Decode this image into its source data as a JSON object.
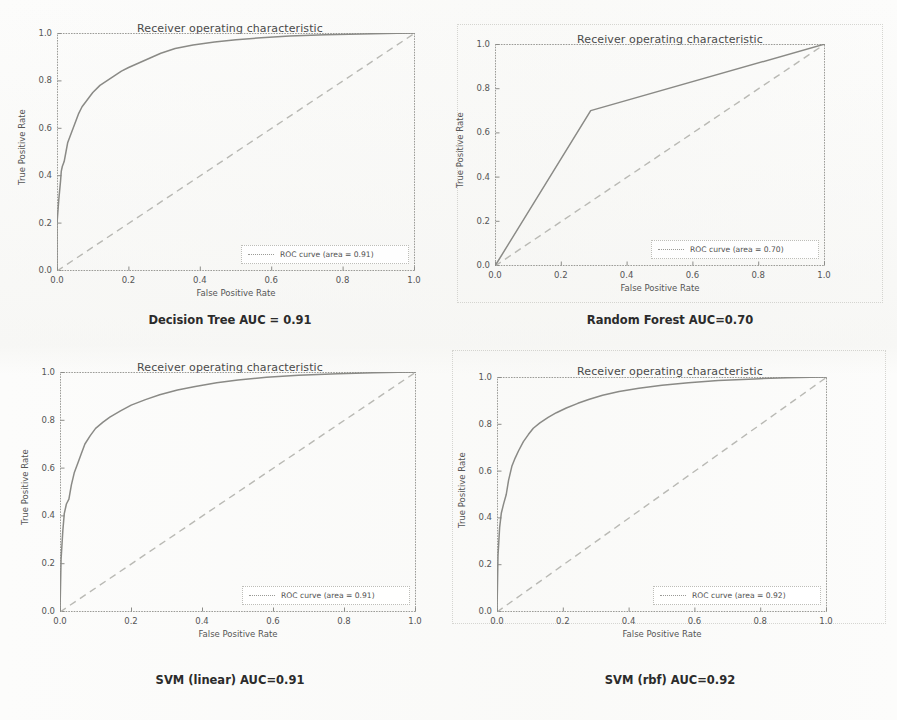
{
  "figure": {
    "background_color": "#fcfcfb",
    "panel_count": 4,
    "layout": "2x2 grid of ROC curve subplots"
  },
  "common": {
    "chart_title": "Receiver operating characteristic",
    "xlabel": "False Positive Rate",
    "ylabel": "True Positive Rate",
    "xticks": [
      "0.0",
      "0.2",
      "0.4",
      "0.6",
      "0.8",
      "1.0"
    ],
    "yticks": [
      "0.0",
      "0.2",
      "0.4",
      "0.6",
      "0.8",
      "1.0"
    ],
    "curve_color": "#8a8a86",
    "chance_color": "#b9b9b4"
  },
  "panels": [
    {
      "id": "decision-tree",
      "title": "Receiver operating characteristic",
      "legend_label": "ROC curve (area = 0.91)",
      "caption": "Decision Tree AUC = 0.91",
      "auc": 0.91
    },
    {
      "id": "random-forest",
      "title": "Receiver operating characteristic",
      "legend_label": "ROC curve (area = 0.70)",
      "caption": "Random Forest AUC=0.70",
      "auc": 0.7
    },
    {
      "id": "svm-linear",
      "title": "Receiver operating characteristic",
      "legend_label": "ROC curve (area = 0.91)",
      "caption": "SVM (linear) AUC=0.91",
      "auc": 0.91
    },
    {
      "id": "svm-rbf",
      "title": "Receiver operating characteristic",
      "legend_label": "ROC curve (area = 0.92)",
      "caption": "SVM (rbf) AUC=0.92",
      "auc": 0.92
    }
  ],
  "chart_data": [
    {
      "type": "line",
      "id": "decision-tree",
      "title": "Receiver operating characteristic",
      "xlabel": "False Positive Rate",
      "ylabel": "True Positive Rate",
      "xlim": [
        0.0,
        1.0
      ],
      "ylim": [
        0.0,
        1.0
      ],
      "grid": false,
      "legend_position": "lower right",
      "series": [
        {
          "name": "ROC curve (area = 0.91)",
          "style": "solid",
          "auc": 0.91,
          "x": [
            0.0,
            0.0,
            0.005,
            0.01,
            0.012,
            0.015,
            0.02,
            0.025,
            0.03,
            0.04,
            0.05,
            0.06,
            0.07,
            0.08,
            0.09,
            0.1,
            0.12,
            0.14,
            0.16,
            0.18,
            0.2,
            0.23,
            0.26,
            0.29,
            0.33,
            0.38,
            0.44,
            0.5,
            0.57,
            0.65,
            0.75,
            0.85,
            0.95,
            1.0
          ],
          "y": [
            0.0,
            0.2,
            0.3,
            0.38,
            0.42,
            0.44,
            0.46,
            0.5,
            0.54,
            0.58,
            0.62,
            0.66,
            0.69,
            0.71,
            0.73,
            0.75,
            0.78,
            0.8,
            0.82,
            0.84,
            0.855,
            0.875,
            0.895,
            0.915,
            0.935,
            0.95,
            0.962,
            0.972,
            0.98,
            0.987,
            0.993,
            0.996,
            0.999,
            1.0
          ]
        },
        {
          "name": "chance",
          "style": "dashed",
          "x": [
            0.0,
            1.0
          ],
          "y": [
            0.0,
            1.0
          ]
        }
      ]
    },
    {
      "type": "line",
      "id": "random-forest",
      "title": "Receiver operating characteristic",
      "xlabel": "False Positive Rate",
      "ylabel": "True Positive Rate",
      "xlim": [
        0.0,
        1.0
      ],
      "ylim": [
        0.0,
        1.0
      ],
      "grid": false,
      "legend_position": "lower right",
      "series": [
        {
          "name": "ROC curve (area = 0.70)",
          "style": "solid",
          "auc": 0.7,
          "x": [
            0.0,
            0.29,
            1.0
          ],
          "y": [
            0.0,
            0.7,
            1.0
          ]
        },
        {
          "name": "chance",
          "style": "dashed",
          "x": [
            0.0,
            1.0
          ],
          "y": [
            0.0,
            1.0
          ]
        }
      ]
    },
    {
      "type": "line",
      "id": "svm-linear",
      "title": "Receiver operating characteristic",
      "xlabel": "False Positive Rate",
      "ylabel": "True Positive Rate",
      "xlim": [
        0.0,
        1.0
      ],
      "ylim": [
        0.0,
        1.0
      ],
      "grid": false,
      "legend_position": "lower right",
      "series": [
        {
          "name": "ROC curve (area = 0.91)",
          "style": "solid",
          "auc": 0.91,
          "x": [
            0.0,
            0.003,
            0.008,
            0.012,
            0.018,
            0.025,
            0.032,
            0.04,
            0.05,
            0.06,
            0.07,
            0.085,
            0.1,
            0.12,
            0.14,
            0.17,
            0.2,
            0.24,
            0.28,
            0.33,
            0.38,
            0.44,
            0.5,
            0.58,
            0.67,
            0.78,
            0.88,
            0.95,
            1.0
          ],
          "y": [
            0.0,
            0.22,
            0.34,
            0.41,
            0.45,
            0.47,
            0.53,
            0.58,
            0.62,
            0.66,
            0.7,
            0.735,
            0.765,
            0.79,
            0.812,
            0.838,
            0.862,
            0.885,
            0.905,
            0.925,
            0.94,
            0.955,
            0.967,
            0.978,
            0.986,
            0.993,
            0.997,
            0.999,
            1.0
          ]
        },
        {
          "name": "chance",
          "style": "dashed",
          "x": [
            0.0,
            1.0
          ],
          "y": [
            0.0,
            1.0
          ]
        }
      ]
    },
    {
      "type": "line",
      "id": "svm-rbf",
      "title": "Receiver operating characteristic",
      "xlabel": "False Positive Rate",
      "ylabel": "True Positive Rate",
      "xlim": [
        0.0,
        1.0
      ],
      "ylim": [
        0.0,
        1.0
      ],
      "grid": false,
      "legend_position": "lower right",
      "series": [
        {
          "name": "ROC curve (area = 0.92)",
          "style": "solid",
          "auc": 0.92,
          "x": [
            0.0,
            0.003,
            0.008,
            0.013,
            0.02,
            0.028,
            0.035,
            0.045,
            0.055,
            0.065,
            0.08,
            0.095,
            0.11,
            0.13,
            0.155,
            0.18,
            0.21,
            0.245,
            0.28,
            0.32,
            0.37,
            0.43,
            0.5,
            0.58,
            0.67,
            0.78,
            0.88,
            0.95,
            1.0
          ],
          "y": [
            0.0,
            0.24,
            0.36,
            0.42,
            0.46,
            0.5,
            0.56,
            0.62,
            0.655,
            0.685,
            0.725,
            0.755,
            0.782,
            0.805,
            0.828,
            0.848,
            0.868,
            0.888,
            0.905,
            0.922,
            0.938,
            0.952,
            0.965,
            0.976,
            0.985,
            0.992,
            0.997,
            0.999,
            1.0
          ]
        },
        {
          "name": "chance",
          "style": "dashed",
          "x": [
            0.0,
            1.0
          ],
          "y": [
            0.0,
            1.0
          ]
        }
      ]
    }
  ]
}
